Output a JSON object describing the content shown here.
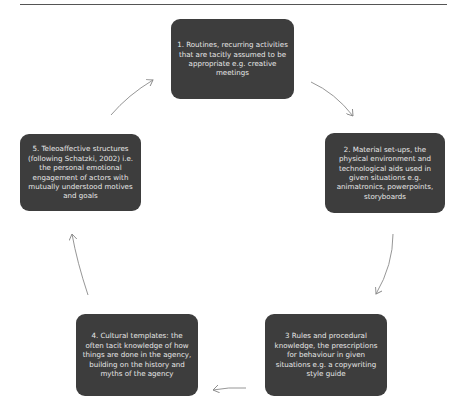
{
  "diagram": {
    "type": "cycle",
    "nodes": [
      {
        "id": 1,
        "text": "1. Routines, recurring activities that are tacitly assumed to be appropriate e.g. creative meetings"
      },
      {
        "id": 2,
        "text": "2. Material set-ups, the physical environment and technological aids used in given situations e.g. animatronics, powerpoints, storyboards"
      },
      {
        "id": 3,
        "text": "3 Rules and procedural knowledge, the prescriptions for behaviour in given situations e.g. a copywriting style guide"
      },
      {
        "id": 4,
        "text": "4. Cultural templates: the often tacit knowledge of how things are done in the agency, building on  the history and myths of the agency"
      },
      {
        "id": 5,
        "text": "5. Teleoaffective structures (following Schatzki, 2002) i.e. the personal emotional engagement of actors with mutually understood motives and goals"
      }
    ],
    "edges": [
      {
        "from": 1,
        "to": 2
      },
      {
        "from": 2,
        "to": 3
      },
      {
        "from": 3,
        "to": 4
      },
      {
        "from": 4,
        "to": 5
      },
      {
        "from": 5,
        "to": 1
      }
    ],
    "colors": {
      "node_fill": "#3d3d3d",
      "node_text": "#e8e8e8",
      "arrow": "#8a8a8a",
      "background": "#ffffff"
    }
  }
}
